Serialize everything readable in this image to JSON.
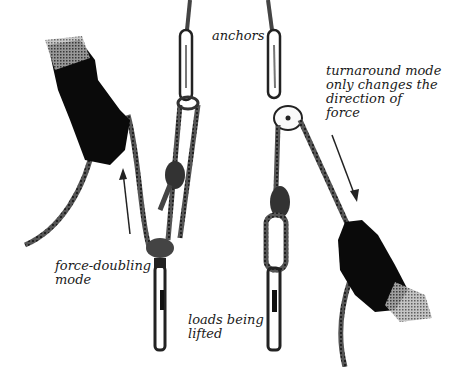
{
  "diagram": {
    "title": "",
    "labels": {
      "anchors": "anchors",
      "turnaround": "turnaround mode\nonly changes the\ndirection of\nforce",
      "force_doubling": "force-doubling\nmode",
      "loads": "loads being\nlifted"
    },
    "colors": {
      "ink": "#1a1a1a",
      "rope": "#3a3a3a",
      "background": "#ffffff"
    },
    "components": [
      {
        "name": "left-hand-glove",
        "description": "gloved hand pulling rope upward"
      },
      {
        "name": "left-anchor-carabiner"
      },
      {
        "name": "left-sling-loop-with-knot"
      },
      {
        "name": "left-pulley"
      },
      {
        "name": "left-load-carabiner"
      },
      {
        "name": "right-anchor-carabiner"
      },
      {
        "name": "right-pulley"
      },
      {
        "name": "right-knot-loop"
      },
      {
        "name": "right-load-carabiner"
      },
      {
        "name": "right-hand-glove",
        "description": "gloved hand pulling rope downward"
      },
      {
        "name": "up-arrow",
        "direction": "up"
      },
      {
        "name": "down-arrow",
        "direction": "down"
      }
    ]
  }
}
